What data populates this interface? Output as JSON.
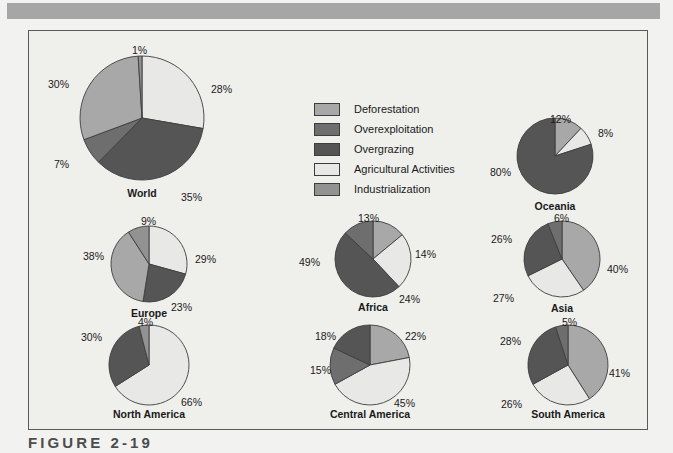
{
  "figure": {
    "caption": "FIGURE 2-19"
  },
  "colors": {
    "deforestation": "#a8a8a8",
    "overexploitation": "#6e6e6e",
    "overgrazing": "#555555",
    "agricultural_activities": "#e8e8e6",
    "industrialization": "#929292",
    "slice_stroke": "#3d3d3d",
    "frame_border": "#5a5a5a",
    "page_background": "#f2f2f0",
    "panel_background": "#efefec",
    "top_bar": "#a6a6a6",
    "caption_text": "#4c4c4c"
  },
  "legend": {
    "items": [
      {
        "label": "Deforestation",
        "color_key": "deforestation"
      },
      {
        "label": "Overexploitation",
        "color_key": "overexploitation"
      },
      {
        "label": "Overgrazing",
        "color_key": "overgrazing"
      },
      {
        "label": "Agricultural Activities",
        "color_key": "agricultural_activities"
      },
      {
        "label": "Industrialization",
        "color_key": "industrialization"
      }
    ]
  },
  "chart_data": {
    "type": "pie",
    "title": "FIGURE 2-19",
    "legend_position": "top-center",
    "categories": [
      "Deforestation",
      "Overexploitation",
      "Overgrazing",
      "Agricultural Activities",
      "Industrialization"
    ],
    "unit": "%",
    "charts": [
      {
        "name": "world",
        "title": "World",
        "radius": 62,
        "center": {
          "x": 141,
          "y": 117
        },
        "title_y": 186,
        "start_angle": 0,
        "slices": [
          {
            "category": "Agricultural Activities",
            "value": 28,
            "label": "28%",
            "label_x": 210,
            "label_y": 82
          },
          {
            "category": "Overgrazing",
            "value": 35,
            "label": "35%",
            "label_y": 190,
            "label_x": 180
          },
          {
            "category": "Overexploitation",
            "value": 7,
            "label": "7%",
            "label_x": 53,
            "label_y": 157
          },
          {
            "category": "Deforestation",
            "value": 30,
            "label": "30%",
            "label_x": 47,
            "label_y": 77
          },
          {
            "category": "Industrialization",
            "value": 1,
            "label": "1%",
            "label_x": 131,
            "label_y": 43
          }
        ]
      },
      {
        "name": "oceania",
        "title": "Oceania",
        "radius": 38,
        "center": {
          "x": 554,
          "y": 155
        },
        "title_y": 199,
        "start_angle": 0,
        "slices": [
          {
            "category": "Deforestation",
            "value": 12,
            "label": "12%",
            "label_x": 549,
            "label_y": 112
          },
          {
            "category": "Agricultural Activities",
            "value": 8,
            "label": "8%",
            "label_x": 597,
            "label_y": 126
          },
          {
            "category": "Overgrazing",
            "value": 80,
            "label": "80%",
            "label_x": 489,
            "label_y": 165
          }
        ]
      },
      {
        "name": "europe",
        "title": "Europe",
        "radius": 38,
        "center": {
          "x": 148,
          "y": 263
        },
        "title_y": 306,
        "start_angle": 0,
        "slices": [
          {
            "category": "Agricultural Activities",
            "value": 29,
            "label": "29%",
            "label_x": 194,
            "label_y": 252
          },
          {
            "category": "Overgrazing",
            "value": 23,
            "label": "23%",
            "label_x": 170,
            "label_y": 300
          },
          {
            "category": "Deforestation",
            "value": 38,
            "label": "38%",
            "label_x": 82,
            "label_y": 249
          },
          {
            "category": "Industrialization",
            "value": 9,
            "label": "9%",
            "label_x": 140,
            "label_y": 214
          }
        ]
      },
      {
        "name": "africa",
        "title": "Africa",
        "radius": 38,
        "center": {
          "x": 372,
          "y": 258
        },
        "title_y": 300,
        "start_angle": 0,
        "slices": [
          {
            "category": "Deforestation",
            "value": 14,
            "label": "14%",
            "label_x": 414,
            "label_y": 247
          },
          {
            "category": "Agricultural Activities",
            "value": 24,
            "label": "24%",
            "label_x": 398,
            "label_y": 292
          },
          {
            "category": "Overgrazing",
            "value": 49,
            "label": "49%",
            "label_x": 298,
            "label_y": 255
          },
          {
            "category": "Overexploitation",
            "value": 13,
            "label": "13%",
            "label_x": 357,
            "label_y": 211
          }
        ]
      },
      {
        "name": "asia",
        "title": "Asia",
        "radius": 38,
        "center": {
          "x": 561,
          "y": 258
        },
        "title_y": 301,
        "start_angle": 0,
        "slices": [
          {
            "category": "Deforestation",
            "value": 40,
            "label": "40%",
            "label_x": 606,
            "label_y": 262
          },
          {
            "category": "Agricultural Activities",
            "value": 27,
            "label": "27%",
            "label_x": 492,
            "label_y": 291
          },
          {
            "category": "Overgrazing",
            "value": 26,
            "label": "26%",
            "label_x": 490,
            "label_y": 232
          },
          {
            "category": "Overexploitation",
            "value": 6,
            "label": "6%",
            "label_x": 553,
            "label_y": 211
          }
        ]
      },
      {
        "name": "north-america",
        "title": "North America",
        "radius": 40,
        "center": {
          "x": 148,
          "y": 364
        },
        "title_y": 407,
        "start_angle": 0,
        "slices": [
          {
            "category": "Agricultural Activities",
            "value": 66,
            "label": "66%",
            "label_x": 180,
            "label_y": 395
          },
          {
            "category": "Overgrazing",
            "value": 30,
            "label": "30%",
            "label_x": 80,
            "label_y": 330
          },
          {
            "category": "Industrialization",
            "value": 4,
            "label": "4%",
            "label_x": 137,
            "label_y": 315
          }
        ]
      },
      {
        "name": "central-america",
        "title": "Central America",
        "radius": 40,
        "center": {
          "x": 369,
          "y": 364
        },
        "title_y": 407,
        "start_angle": 0,
        "slices": [
          {
            "category": "Deforestation",
            "value": 22,
            "label": "22%",
            "label_x": 404,
            "label_y": 329
          },
          {
            "category": "Agricultural Activities",
            "value": 45,
            "label": "45%",
            "label_x": 393,
            "label_y": 396
          },
          {
            "category": "Overexploitation",
            "value": 15,
            "label": "15%",
            "label_x": 309,
            "label_y": 363
          },
          {
            "category": "Overgrazing",
            "value": 18,
            "label": "18%",
            "label_x": 314,
            "label_y": 329
          }
        ]
      },
      {
        "name": "south-america",
        "title": "South America",
        "radius": 40,
        "center": {
          "x": 567,
          "y": 364
        },
        "title_y": 407,
        "start_angle": 0,
        "slices": [
          {
            "category": "Deforestation",
            "value": 41,
            "label": "41%",
            "label_x": 608,
            "label_y": 366
          },
          {
            "category": "Agricultural Activities",
            "value": 26,
            "label": "26%",
            "label_x": 500,
            "label_y": 397
          },
          {
            "category": "Overgrazing",
            "value": 28,
            "label": "28%",
            "label_x": 499,
            "label_y": 334
          },
          {
            "category": "Overexploitation",
            "value": 5,
            "label": "5%",
            "label_x": 561,
            "label_y": 315
          }
        ]
      }
    ]
  }
}
